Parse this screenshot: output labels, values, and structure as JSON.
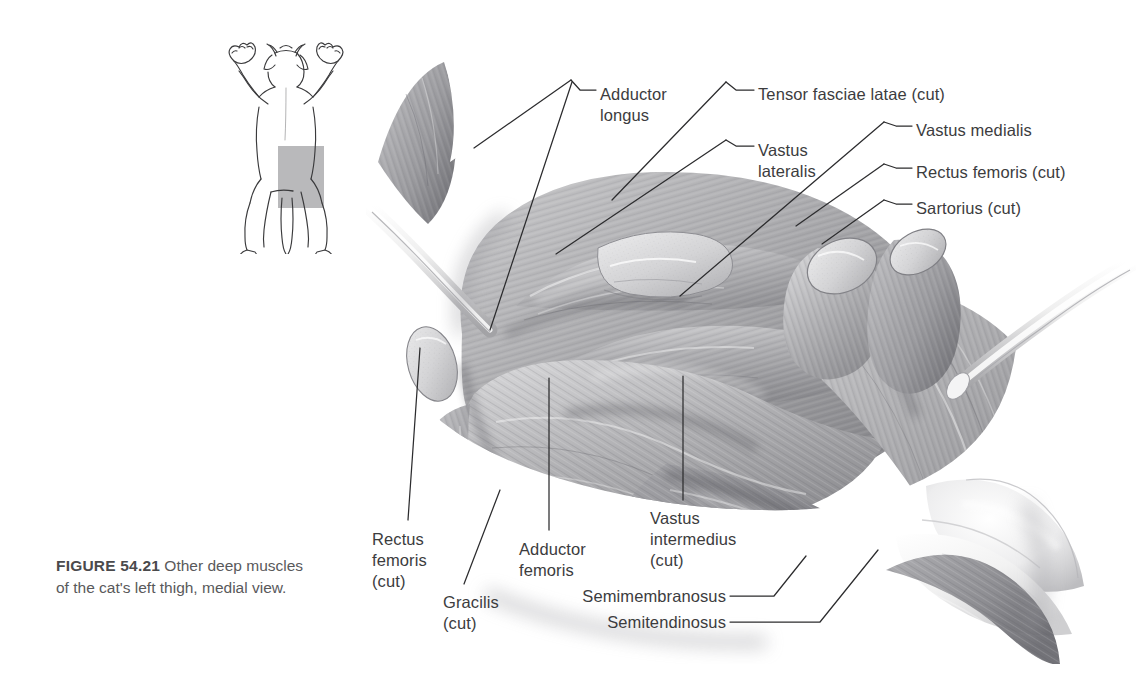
{
  "figure": {
    "number_label": "FIGURE 54.21",
    "caption_text": "  Other deep muscles of the cat's left thigh, medial view.",
    "full_caption": "FIGURE 54.21  Other deep muscles of the cat's left thigh, medial view.",
    "view": "medial view",
    "page_background": "#ffffff",
    "text_color": "#3c3c3e",
    "caption_color": "#59595b",
    "line_color": "#2c2c2e"
  },
  "inset": {
    "name": "cat-orientation-diagram",
    "description": "ventral view line drawing of a cat with shaded region over left thigh",
    "highlight_color": "#b9b9bb",
    "outline_color": "#3a3a3c"
  },
  "labels": [
    {
      "id": "adductor-longus",
      "text": "Adductor\nlongus",
      "x": 600,
      "y": 84,
      "align": "left"
    },
    {
      "id": "tensor-fasciae-latae",
      "text": "Tensor fasciae latae (cut)",
      "x": 758,
      "y": 84,
      "align": "left"
    },
    {
      "id": "vastus-lateralis",
      "text": "Vastus\nlateralis",
      "x": 758,
      "y": 140,
      "align": "left"
    },
    {
      "id": "vastus-medialis",
      "text": "Vastus medialis",
      "x": 916,
      "y": 120,
      "align": "left"
    },
    {
      "id": "rectus-femoris-cut-r",
      "text": "Rectus femoris (cut)",
      "x": 916,
      "y": 162,
      "align": "left"
    },
    {
      "id": "sartorius-cut",
      "text": "Sartorius (cut)",
      "x": 916,
      "y": 198,
      "align": "left"
    },
    {
      "id": "rectus-femoris-cut-l",
      "text": "Rectus\nfemoris\n(cut)",
      "x": 372,
      "y": 529,
      "align": "left"
    },
    {
      "id": "gracilis-cut",
      "text": "Gracilis\n(cut)",
      "x": 443,
      "y": 592,
      "align": "left"
    },
    {
      "id": "adductor-femoris",
      "text": "Adductor\nfemoris",
      "x": 519,
      "y": 539,
      "align": "left"
    },
    {
      "id": "vastus-intermedius",
      "text": "Vastus\nintermedius\n(cut)",
      "x": 650,
      "y": 508,
      "align": "left"
    },
    {
      "id": "semimembranosus",
      "text": "Semimembranosus",
      "x": 726,
      "y": 594,
      "align": "right"
    },
    {
      "id": "semitendinosus",
      "text": "Semitendinosus",
      "x": 726,
      "y": 620,
      "align": "right"
    }
  ],
  "structures": [
    "Adductor longus",
    "Tensor fasciae latae (cut)",
    "Vastus lateralis",
    "Vastus medialis",
    "Rectus femoris (cut)",
    "Sartorius (cut)",
    "Rectus femoris (cut)",
    "Gracilis (cut)",
    "Adductor femoris",
    "Vastus intermedius (cut)",
    "Semimembranosus",
    "Semitendinosus"
  ]
}
